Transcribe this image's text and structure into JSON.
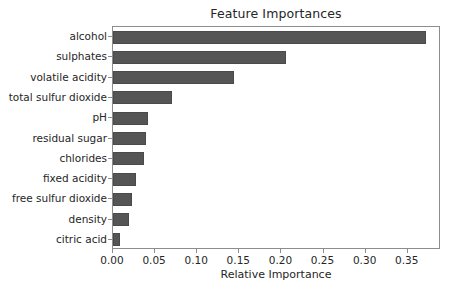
{
  "chart_data": {
    "type": "bar",
    "orientation": "horizontal",
    "title": "Feature Importances",
    "xlabel": "Relative Importance",
    "ylabel": "",
    "grid": false,
    "legend": null,
    "xlim": [
      0.0,
      0.3895
    ],
    "xticks": [
      0.0,
      0.05,
      0.1,
      0.15,
      0.2,
      0.25,
      0.3,
      0.35
    ],
    "xtick_labels": [
      "0.00",
      "0.05",
      "0.10",
      "0.15",
      "0.20",
      "0.25",
      "0.30",
      "0.35"
    ],
    "categories": [
      "alcohol",
      "sulphates",
      "volatile acidity",
      "total sulfur dioxide",
      "pH",
      "residual sugar",
      "chlorides",
      "fixed acidity",
      "free sulfur dioxide",
      "density",
      "citric acid"
    ],
    "values": [
      0.372,
      0.205,
      0.144,
      0.07,
      0.042,
      0.039,
      0.037,
      0.027,
      0.022,
      0.019,
      0.008
    ],
    "bar_color": "#555555",
    "axes_color": "#8d8d8d",
    "text_color": "#262626",
    "background": "#ffffff"
  }
}
